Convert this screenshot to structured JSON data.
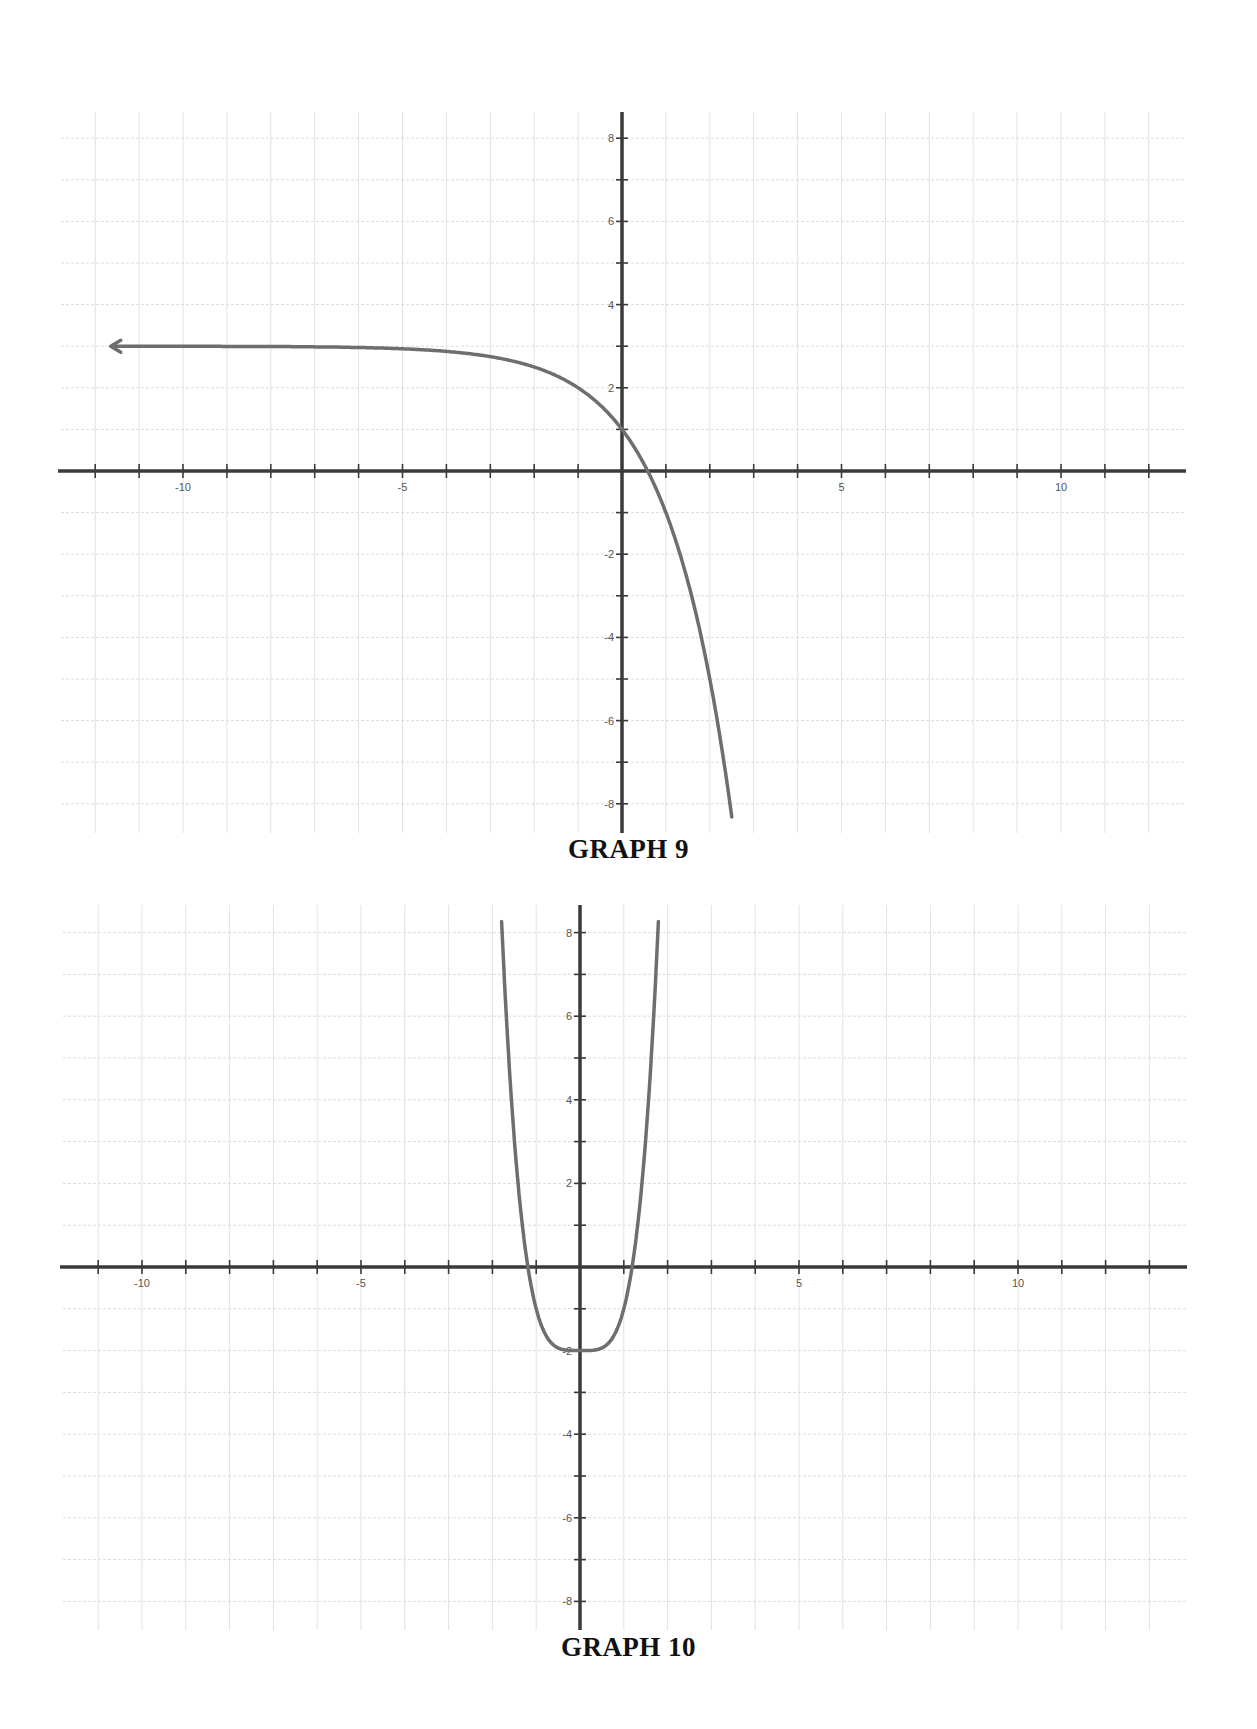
{
  "graphs": [
    {
      "caption": "GRAPH 9",
      "layout": {
        "x_left": 61,
        "x_right": 1186,
        "y_top": 112,
        "y_bottom": 833,
        "origin_x": 622,
        "origin_y": 471,
        "unit_x": 43.9,
        "unit_y": 41.6,
        "caption_y": 834
      },
      "arrow_left": true
    },
    {
      "caption": "GRAPH 10",
      "layout": {
        "x_left": 63,
        "x_right": 1187,
        "y_top": 905,
        "y_bottom": 1630,
        "origin_x": 580,
        "origin_y": 1267,
        "unit_x": 43.8,
        "unit_y": 41.8,
        "caption_y": 1632
      },
      "arrow_left": false
    }
  ],
  "colors": {
    "curve": "#6e6e6e",
    "axis": "#3a3a3a",
    "grid": "#dcdcdc",
    "caption": "#111111"
  },
  "chart_data": [
    {
      "type": "line",
      "title": "GRAPH 9",
      "xlabel": "",
      "ylabel": "",
      "x_ticks": [
        -10,
        -5,
        5,
        10
      ],
      "y_ticks": [
        8,
        6,
        4,
        2,
        -2,
        -4,
        -6,
        -8
      ],
      "xlim": [
        -11.7,
        12.9
      ],
      "ylim": [
        -8.7,
        8.6
      ],
      "grid": true,
      "legend": null,
      "series": [
        {
          "name": "curve",
          "description": "Decreasing exponential with horizontal asymptote y = 3 (arrow to the left); passes (0, 1), crosses x-axis near x ≈ 0.6, exits the bottom near x ≈ 2.5",
          "approx_function": "y = 3 - 2*2^x",
          "x": [
            -11.6,
            -8,
            -6,
            -4,
            -3,
            -2,
            -1,
            0,
            0.585,
            1,
            1.5,
            2,
            2.46
          ],
          "y": [
            3.0,
            2.99,
            2.97,
            2.88,
            2.75,
            2.5,
            2.0,
            1.0,
            0.0,
            -1.0,
            -2.66,
            -5.0,
            -8.0
          ]
        }
      ]
    },
    {
      "type": "line",
      "title": "GRAPH 10",
      "xlabel": "",
      "ylabel": "",
      "x_ticks": [
        -10,
        -5,
        5,
        10
      ],
      "y_ticks": [
        8,
        6,
        4,
        2,
        -2,
        -4,
        -6,
        -8
      ],
      "xlim": [
        -11.8,
        13.9
      ],
      "ylim": [
        -8.7,
        8.7
      ],
      "grid": true,
      "legend": null,
      "series": [
        {
          "name": "curve",
          "description": "Quartic-shaped U curve with flat minimum at (0, -2); crosses x-axis near x ≈ ±1.19; exits top near x ≈ ±1.78",
          "approx_function": "y = x^4 - 2",
          "x": [
            -1.78,
            -1.5,
            -1.19,
            -1,
            -0.5,
            0,
            0.5,
            1,
            1.19,
            1.5,
            1.78
          ],
          "y": [
            8.0,
            3.06,
            0.0,
            -1.0,
            -1.94,
            -2.0,
            -1.94,
            -1.0,
            0.0,
            3.06,
            8.0
          ]
        }
      ]
    }
  ]
}
